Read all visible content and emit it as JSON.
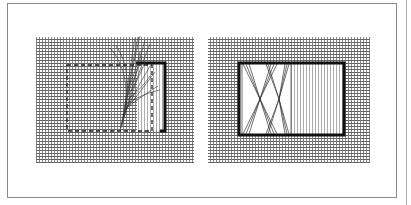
{
  "figure": {
    "colors": {
      "ink": "#222222",
      "grid": "#6a6a6a",
      "frame": "#8a8a8a",
      "background": "#ffffff"
    },
    "panels": [
      {
        "id": "left",
        "subject": "fabric grid with dashed square outline; horizontal threads withdrawn in right part, fanning out; heavy stitched border on top and right",
        "fabric": {
          "x": 36,
          "y": 37,
          "w": 158,
          "h": 126
        },
        "dashed_square": {
          "x": 67,
          "y": 65,
          "w": 85,
          "h": 66
        },
        "cut_region": {
          "x": 136,
          "y": 63,
          "w": 30,
          "h": 68
        }
      },
      {
        "id": "right",
        "subject": "fabric grid with heavy buttonhole-stitched rectangle; left half shows vertical threads bundled into two hourglass/X shapes; right half shows remaining vertical threads",
        "fabric": {
          "x": 208,
          "y": 37,
          "w": 162,
          "h": 126
        },
        "border_rect": {
          "x": 238,
          "y": 62,
          "w": 106,
          "h": 73
        },
        "divider_x": 291,
        "bundles": 2
      }
    ]
  }
}
